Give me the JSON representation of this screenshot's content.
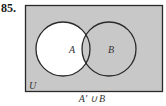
{
  "problem_number": "85.",
  "diagram": {
    "universe_label": "U",
    "set_a_label": "A",
    "set_b_label": "B",
    "shaded_region": "A' ∪ B",
    "shade_color": "#c8c8c8",
    "unshaded_color": "#ffffff",
    "stroke_color": "#2a2a2a"
  },
  "caption": "A′ ∪ B"
}
